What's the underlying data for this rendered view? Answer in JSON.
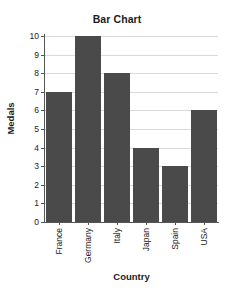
{
  "chart_data": {
    "type": "bar",
    "title": "Bar Chart",
    "xlabel": "Country",
    "ylabel": "Medals",
    "categories": [
      "France",
      "Germany",
      "Italy",
      "Japan",
      "Spain",
      "USA"
    ],
    "values": [
      7,
      10,
      8,
      4,
      3,
      6
    ],
    "ylim": [
      0,
      10
    ],
    "ytick_labels": [
      "10",
      "9",
      "8",
      "7",
      "6",
      "5",
      "4",
      "3",
      "2",
      "1",
      "0"
    ],
    "ytick_values": [
      10,
      9,
      8,
      7,
      6,
      5,
      4,
      3,
      2,
      1,
      0
    ],
    "ystep": 1,
    "grid": "horizontal",
    "legend": "none",
    "bar_color": "#4a4a4a",
    "grid_color": "#d9d9d9",
    "axis_color": "#555555",
    "background_color": "#ffffff"
  }
}
